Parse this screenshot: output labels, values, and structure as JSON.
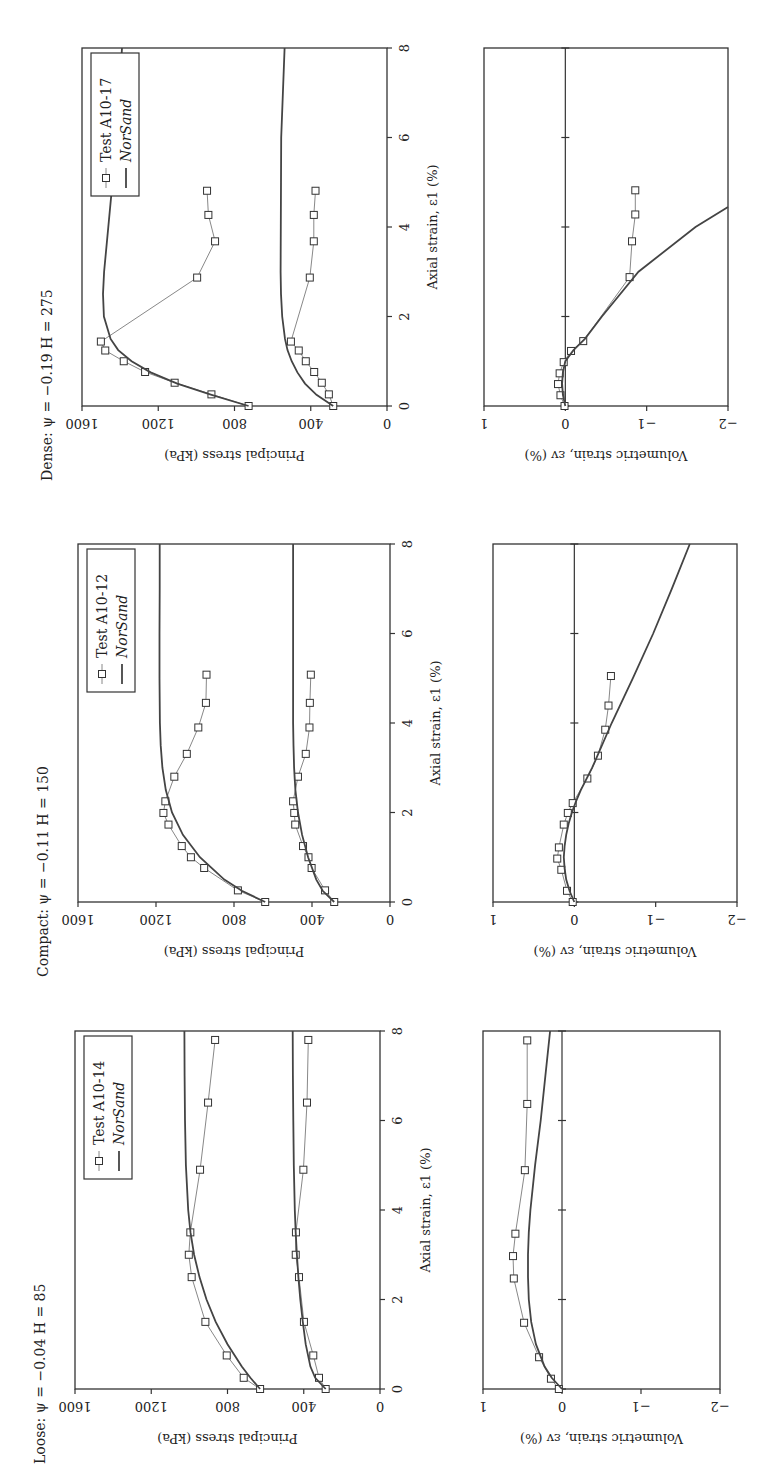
{
  "figure": {
    "orientation": "rotated -90 degrees (landscape figure on portrait page)"
  },
  "chart_data": [
    {
      "id": "loose-stress",
      "type": "line",
      "title": "Loose: ψ = −0.04 H = 85",
      "xlabel": "Axial strain, ε1 (%)",
      "ylabel": "Principal stress (kPa)",
      "xlim": [
        0,
        8
      ],
      "ylim": [
        0,
        1600
      ],
      "xticks": [
        0,
        2,
        4,
        6,
        8
      ],
      "yticks": [
        0,
        400,
        800,
        1200,
        1600
      ],
      "grid": false,
      "legend": {
        "position": "upper right",
        "entries": [
          "Test A10-14",
          "NorSand"
        ]
      },
      "series": [
        {
          "name": "Test A10-14 σ1",
          "style": "markers+line",
          "x": [
            0,
            0.25,
            0.75,
            1.5,
            2.5,
            3.0,
            3.5,
            4.9,
            6.4,
            7.8
          ],
          "y": [
            629,
            715,
            804,
            916,
            988,
            1003,
            995,
            944,
            902,
            865
          ]
        },
        {
          "name": "Test A10-14 σ3",
          "style": "markers+line",
          "x": [
            0,
            0.25,
            0.75,
            1.5,
            2.5,
            3.0,
            3.5,
            4.9,
            6.4,
            7.8
          ],
          "y": [
            285,
            320,
            350,
            399,
            425,
            442,
            441,
            402,
            383,
            376
          ]
        },
        {
          "name": "NorSand σ1",
          "style": "line",
          "x": [
            0,
            0.25,
            0.5,
            1,
            1.5,
            2,
            2.5,
            3,
            3.5,
            4,
            5,
            6,
            7,
            8
          ],
          "y": [
            629,
            680,
            725,
            800,
            862,
            910,
            947,
            975,
            994,
            1006,
            1018,
            1023,
            1025,
            1026
          ]
        },
        {
          "name": "NorSand σ3",
          "style": "line",
          "x": [
            0,
            0.25,
            0.5,
            1,
            1.5,
            2,
            2.5,
            3,
            3.5,
            4,
            5,
            6,
            7,
            8
          ],
          "y": [
            285,
            340,
            365,
            390,
            405,
            418,
            428,
            436,
            442,
            447,
            452,
            455,
            457,
            458
          ]
        }
      ]
    },
    {
      "id": "loose-volumetric",
      "type": "line",
      "title": "",
      "xlabel": "",
      "ylabel": "Volumetric strain, εv (%)",
      "xlim": [
        0,
        8
      ],
      "ylim": [
        -2,
        1
      ],
      "xticks": [
        0,
        2,
        4,
        6,
        8
      ],
      "yticks": [
        -2,
        -1,
        0,
        1
      ],
      "grid": false,
      "series": [
        {
          "name": "Test A10-14 εv",
          "style": "markers+line",
          "x": [
            0,
            0.23,
            0.71,
            1.48,
            2.47,
            2.97,
            3.47,
            4.89,
            6.37,
            7.79
          ],
          "y": [
            0.04,
            0.14,
            0.29,
            0.48,
            0.61,
            0.62,
            0.59,
            0.47,
            0.44,
            0.44
          ]
        },
        {
          "name": "NorSand εv",
          "style": "line",
          "x": [
            0,
            0.25,
            0.5,
            1,
            1.5,
            2,
            2.5,
            3,
            3.5,
            4,
            5,
            6,
            7,
            8
          ],
          "y": [
            0,
            0.13,
            0.22,
            0.33,
            0.39,
            0.42,
            0.43,
            0.43,
            0.42,
            0.4,
            0.34,
            0.27,
            0.21,
            0.15
          ]
        }
      ]
    },
    {
      "id": "compact-stress",
      "type": "line",
      "title": "Compact: ψ = −0.11 H = 150",
      "xlabel": "Axial strain, ε1 (%)",
      "ylabel": "Principal stress (kPa)",
      "xlim": [
        0,
        8
      ],
      "ylim": [
        0,
        1600
      ],
      "xticks": [
        0,
        2,
        4,
        6,
        8
      ],
      "yticks": [
        0,
        400,
        800,
        1200,
        1600
      ],
      "grid": false,
      "legend": {
        "position": "upper right",
        "entries": [
          "Test A10-12",
          "NorSand"
        ]
      },
      "series": [
        {
          "name": "Test A10-12 σ1",
          "style": "markers+line",
          "x": [
            0,
            0.26,
            0.76,
            1.0,
            1.25,
            1.73,
            1.99,
            2.25,
            2.8,
            3.31,
            3.9,
            4.45,
            5.08
          ],
          "y": [
            640,
            780,
            953,
            1021,
            1068,
            1136,
            1162,
            1152,
            1106,
            1042,
            983,
            944,
            941
          ]
        },
        {
          "name": "Test A10-12 σ3",
          "style": "markers+line",
          "x": [
            0,
            0.26,
            0.76,
            1.0,
            1.25,
            1.73,
            1.99,
            2.25,
            2.8,
            3.31,
            3.9,
            4.45,
            5.08
          ],
          "y": [
            286,
            333,
            402,
            418,
            446,
            486,
            491,
            497,
            472,
            432,
            413,
            411,
            406
          ]
        },
        {
          "name": "NorSand σ1",
          "style": "line",
          "x": [
            0,
            0.25,
            0.5,
            1,
            1.5,
            2,
            2.5,
            3,
            3.5,
            4,
            5,
            6,
            7,
            8
          ],
          "y": [
            640,
            760,
            850,
            975,
            1062,
            1118,
            1150,
            1167,
            1176,
            1180,
            1182,
            1182,
            1181,
            1181
          ]
        },
        {
          "name": "NorSand σ3",
          "style": "line",
          "x": [
            0,
            0.25,
            0.5,
            1,
            1.5,
            2,
            2.5,
            3,
            3.5,
            4,
            5,
            6,
            7,
            8
          ],
          "y": [
            286,
            345,
            378,
            420,
            451,
            472,
            485,
            492,
            495,
            497,
            497,
            497,
            497,
            497
          ]
        }
      ]
    },
    {
      "id": "compact-volumetric",
      "type": "line",
      "title": "",
      "xlabel": "",
      "ylabel": "Volumetric strain, εv (%)",
      "xlim": [
        0,
        8
      ],
      "ylim": [
        -2,
        1
      ],
      "xticks": [
        0,
        2,
        4,
        6,
        8
      ],
      "yticks": [
        -2,
        -1,
        0,
        1
      ],
      "grid": false,
      "series": [
        {
          "name": "Test A10-12 εv",
          "style": "markers+line",
          "x": [
            0,
            0.25,
            0.72,
            0.97,
            1.22,
            1.73,
            1.99,
            2.21,
            2.76,
            3.27,
            3.85,
            4.39,
            5.05
          ],
          "y": [
            0.02,
            0.09,
            0.16,
            0.21,
            0.19,
            0.13,
            0.08,
            0.02,
            -0.16,
            -0.29,
            -0.38,
            -0.42,
            -0.45
          ]
        },
        {
          "name": "NorSand εv",
          "style": "line",
          "x": [
            0,
            0.25,
            0.5,
            0.75,
            1,
            1.25,
            1.5,
            1.75,
            2,
            2.25,
            2.5,
            3,
            4,
            5,
            6,
            7,
            8
          ],
          "y": [
            0,
            0.06,
            0.1,
            0.12,
            0.13,
            0.12,
            0.1,
            0.07,
            0.03,
            -0.02,
            -0.08,
            -0.22,
            -0.46,
            -0.72,
            -0.97,
            -1.2,
            -1.42
          ]
        }
      ]
    },
    {
      "id": "dense-stress",
      "type": "line",
      "title": "Dense: ψ = −0.19 H = 275",
      "xlabel": "Axial strain, ε1 (%)",
      "ylabel": "Principal stress (kPa)",
      "xlim": [
        0,
        8
      ],
      "ylim": [
        0,
        1600
      ],
      "xticks": [
        0,
        2,
        4,
        6,
        8
      ],
      "yticks": [
        0,
        400,
        800,
        1200,
        1600
      ],
      "grid": false,
      "legend": {
        "position": "upper right",
        "entries": [
          "Test A10-17",
          "NorSand"
        ]
      },
      "series": [
        {
          "name": "Test A10-17 σ1",
          "style": "markers+line",
          "x": [
            0,
            0.26,
            0.52,
            0.76,
            1.0,
            1.24,
            1.44,
            2.87,
            3.68,
            4.27,
            4.81
          ],
          "y": [
            726,
            921,
            1114,
            1269,
            1381,
            1478,
            1501,
            996,
            902,
            937,
            944
          ]
        },
        {
          "name": "Test A10-17 σ3",
          "style": "markers+line",
          "x": [
            0,
            0.26,
            0.52,
            0.76,
            1.0,
            1.24,
            1.44,
            2.87,
            3.68,
            4.27,
            4.81
          ],
          "y": [
            282,
            305,
            342,
            382,
            426,
            463,
            504,
            405,
            384,
            384,
            375
          ]
        },
        {
          "name": "NorSand σ1",
          "style": "line",
          "x": [
            0,
            0.25,
            0.5,
            0.75,
            1,
            1.25,
            1.5,
            2,
            2.5,
            3,
            4,
            5,
            6,
            7,
            8
          ],
          "y": [
            726,
            920,
            1100,
            1240,
            1340,
            1410,
            1450,
            1485,
            1490,
            1484,
            1462,
            1440,
            1420,
            1405,
            1390
          ]
        },
        {
          "name": "NorSand σ3",
          "style": "line",
          "x": [
            0,
            0.25,
            0.5,
            0.75,
            1,
            1.25,
            1.5,
            2,
            2.5,
            3,
            4,
            5,
            6,
            7,
            8
          ],
          "y": [
            282,
            370,
            430,
            470,
            500,
            522,
            535,
            550,
            556,
            558,
            557,
            556,
            555,
            546,
            537
          ]
        }
      ]
    },
    {
      "id": "dense-volumetric",
      "type": "line",
      "title": "",
      "xlabel": "",
      "ylabel": "Volumetric strain, εv (%)",
      "xlim": [
        0,
        8
      ],
      "ylim": [
        -2,
        1
      ],
      "xticks": [
        0,
        2,
        4,
        6,
        8
      ],
      "yticks": [
        -2,
        -1,
        0,
        1
      ],
      "grid": false,
      "series": [
        {
          "name": "Test A10-17 εv",
          "style": "markers+line",
          "x": [
            0,
            0.24,
            0.49,
            0.73,
            0.98,
            1.23,
            1.45,
            2.88,
            3.68,
            4.28,
            4.82
          ],
          "y": [
            0.01,
            0.06,
            0.09,
            0.07,
            0.02,
            -0.07,
            -0.22,
            -0.79,
            -0.82,
            -0.86,
            -0.86
          ]
        },
        {
          "name": "NorSand εv",
          "style": "line",
          "x": [
            0,
            0.25,
            0.5,
            0.75,
            1,
            1.25,
            1.5,
            2,
            3,
            4,
            4.45
          ],
          "y": [
            0,
            0.03,
            0.04,
            0.03,
            0,
            -0.1,
            -0.24,
            -0.45,
            -0.9,
            -1.6,
            -2.0
          ]
        }
      ]
    }
  ]
}
